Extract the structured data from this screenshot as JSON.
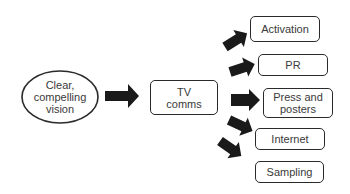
{
  "diagram": {
    "source": {
      "label": "Clear,\ncompelling\nvision"
    },
    "hub": {
      "label": "TV\ncomms"
    },
    "targets": [
      {
        "label": "Activation"
      },
      {
        "label": "PR"
      },
      {
        "label": "Press and\nposters"
      },
      {
        "label": "Internet"
      },
      {
        "label": "Sampling"
      }
    ],
    "colors": {
      "arrow": "#1a1a1a",
      "border": "#2a2a2a",
      "text": "#3a3a3a"
    }
  }
}
